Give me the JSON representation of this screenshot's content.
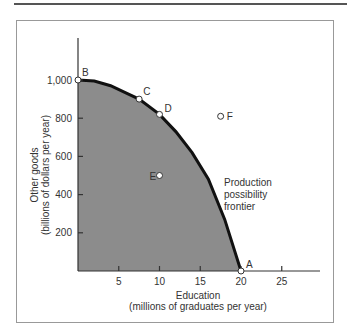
{
  "chart_data": {
    "type": "line",
    "title": "",
    "xlabel": "Education",
    "xlabel_sub": "(millions of graduates per year)",
    "ylabel": "Other goods",
    "ylabel_sub": "(billions of dollars per year)",
    "xlim": [
      0,
      29
    ],
    "ylim": [
      0,
      1100
    ],
    "xticks": [
      5,
      10,
      15,
      20,
      25
    ],
    "yticks": [
      200,
      400,
      600,
      800,
      1000
    ],
    "ytick_labels": [
      "200",
      "400",
      "600",
      "800",
      "1,000"
    ],
    "grid": false,
    "series": [
      {
        "name": "Production possibility frontier",
        "x": [
          0,
          2,
          4,
          6,
          7.5,
          10,
          12,
          14,
          16,
          18,
          20
        ],
        "y": [
          1000,
          995,
          970,
          930,
          900,
          820,
          730,
          620,
          480,
          270,
          0
        ]
      }
    ],
    "points": [
      {
        "label": "A",
        "x": 20,
        "y": 0
      },
      {
        "label": "B",
        "x": 0,
        "y": 1000
      },
      {
        "label": "C",
        "x": 7.5,
        "y": 900
      },
      {
        "label": "D",
        "x": 10,
        "y": 820
      },
      {
        "label": "E",
        "x": 10,
        "y": 500
      },
      {
        "label": "F",
        "x": 17.5,
        "y": 810
      }
    ],
    "annotations": [
      "Production",
      "possibility",
      "frontier"
    ],
    "fill_color": "#8a8a8a"
  }
}
